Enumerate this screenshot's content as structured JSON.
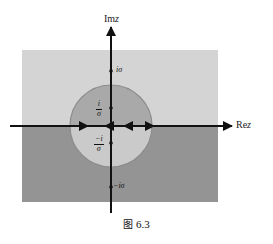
{
  "figure": {
    "caption_symbol": "图",
    "caption_number": "6.3",
    "axes": {
      "imaginary_label_prefix": "Im",
      "imaginary_label_var": "z",
      "real_label_prefix": "Re",
      "real_label_var": "z"
    },
    "colors": {
      "upper_region": "#d3d3d3",
      "lower_region": "#939393",
      "disk_upper": "#a8a8a8",
      "disk_lower": "#c9c9c9",
      "disk_stroke": "#8a8a8a",
      "axis": "#111111",
      "background": "#ffffff"
    },
    "points": [
      {
        "name": "i-sigma",
        "label_num": "i",
        "label_den": "",
        "label": "iσ",
        "x": 111,
        "y": 71
      },
      {
        "name": "i-over-sigma",
        "label_num": "i",
        "label_den": "σ",
        "label": "i/σ",
        "x": 111,
        "y": 108
      },
      {
        "name": "minus-i-over-sigma",
        "label_num": "−i",
        "label_den": "σ",
        "label": "−i/σ",
        "x": 111,
        "y": 143
      },
      {
        "name": "minus-i-sigma",
        "label_num": "−i",
        "label_den": "",
        "label": "−iσ",
        "x": 111,
        "y": 187
      }
    ],
    "labels": {
      "i_sigma": "iσ",
      "minus_i_sigma": "−iσ",
      "i_over_sigma_num": "i",
      "i_over_sigma_den": "σ",
      "minus_i_over_sigma_num": "−i",
      "minus_i_over_sigma_den": "σ"
    },
    "geometry": {
      "rect_x": 22,
      "rect_y": 50,
      "rect_w": 196,
      "rect_h": 152,
      "origin_x": 111,
      "origin_y": 126,
      "circle_radius": 41,
      "real_axis_y": 126,
      "imag_axis_x": 111
    },
    "arrow_markers": [
      {
        "name": "arrow-left-outer",
        "x": 86,
        "direction": "right"
      },
      {
        "name": "arrow-inner-left",
        "x": 107,
        "direction": "left"
      },
      {
        "name": "arrow-inner-right",
        "x": 126,
        "direction": "left"
      },
      {
        "name": "arrow-right-outer",
        "x": 152,
        "direction": "right"
      }
    ]
  }
}
